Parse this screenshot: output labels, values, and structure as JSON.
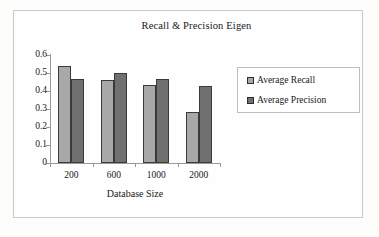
{
  "chart_data": {
    "type": "bar",
    "title": "Recall & Precision Eigen",
    "xlabel": "Database Size",
    "ylabel": "",
    "categories": [
      "200",
      "600",
      "1000",
      "2000"
    ],
    "series": [
      {
        "name": "Average Recall",
        "values": [
          0.54,
          0.46,
          0.435,
          0.285
        ],
        "color": "#a8a8a8"
      },
      {
        "name": "Average Precision",
        "values": [
          0.465,
          0.5,
          0.465,
          0.43
        ],
        "color": "#707070"
      }
    ],
    "ylim": [
      0,
      0.6
    ],
    "ytick_labels": [
      "0",
      "0.1",
      "0.2",
      "0.3",
      "0.4",
      "0.5",
      "0.6"
    ],
    "ytick_values": [
      0,
      0.1,
      0.2,
      0.3,
      0.4,
      0.5,
      0.6
    ],
    "grid": false,
    "legend_position": "right"
  },
  "legend": {
    "items": [
      {
        "label": "Average Recall"
      },
      {
        "label": "Average Precision"
      }
    ]
  }
}
